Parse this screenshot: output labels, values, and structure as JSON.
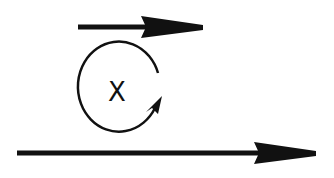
{
  "diagram": {
    "background": "#ffffff",
    "stroke_color": "#111111",
    "top_arrow": {
      "direction": "right",
      "x1": 78,
      "x2": 203,
      "y": 27
    },
    "rotation": {
      "center_label": "X",
      "direction": "clockwise",
      "cx": 117,
      "cy": 88
    },
    "bottom_arrow": {
      "direction": "right",
      "x1": 17,
      "x2": 316,
      "y": 153
    }
  }
}
